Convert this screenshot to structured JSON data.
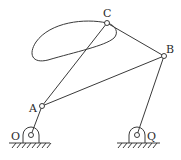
{
  "diagram": {
    "type": "four-bar linkage with coupler curve",
    "points": {
      "O": {
        "label": "O",
        "x": 31,
        "y": 135
      },
      "Q": {
        "label": "Q",
        "x": 137,
        "y": 135
      },
      "A": {
        "label": "A",
        "x": 42,
        "y": 106
      },
      "B": {
        "label": "B",
        "x": 164,
        "y": 56
      },
      "C": {
        "label": "C",
        "x": 107,
        "y": 23
      }
    },
    "links": [
      {
        "from": "O",
        "to": "A"
      },
      {
        "from": "A",
        "to": "B"
      },
      {
        "from": "A",
        "to": "C"
      },
      {
        "from": "C",
        "to": "B"
      },
      {
        "from": "Q",
        "to": "B"
      }
    ],
    "curve": "coupler curve traced by point C"
  }
}
